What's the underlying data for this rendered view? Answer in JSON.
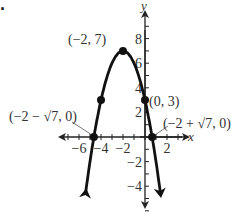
{
  "problem_marker": ".",
  "chart_data": {
    "type": "line",
    "title": "",
    "function": "y = -(x + 2)^2 + 7",
    "xlabel": "x",
    "ylabel": "y",
    "xlim": [
      -6.8,
      3
    ],
    "ylim": [
      -6,
      10
    ],
    "x_ticks": [
      -6,
      -4,
      -2,
      2
    ],
    "x_tick_labels": [
      "−6",
      "−4",
      "−2",
      "2"
    ],
    "y_ticks": [
      -4,
      -2,
      2,
      4,
      6,
      8
    ],
    "y_tick_labels": [
      "−4",
      "−2",
      "2",
      "4",
      "6",
      "8"
    ],
    "grid": false,
    "points": [
      {
        "label": "(−2, 7)",
        "x": -2,
        "y": 7
      },
      {
        "label": "(0, 3)",
        "x": 0,
        "y": 3
      },
      {
        "label": "(−2 − √7, 0)",
        "x": -4.646,
        "y": 0
      },
      {
        "label": "(−2 + √7, 0)",
        "x": 0.646,
        "y": 0
      },
      {
        "label": "",
        "x": -4,
        "y": 3
      }
    ],
    "curve_color": "#111111",
    "axis_color": "#222222"
  }
}
